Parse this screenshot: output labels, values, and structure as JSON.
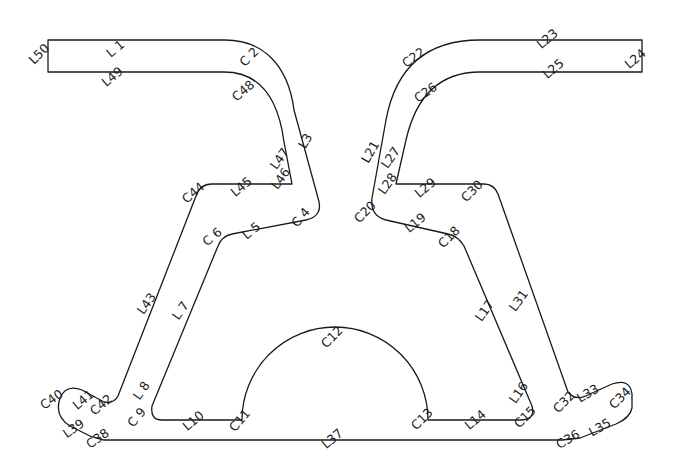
{
  "diagram": {
    "type": "profile-outline",
    "stroke_color": "#1a1a1a",
    "background": "#ffffff",
    "labels": [
      {
        "id": "L1",
        "text": "L 1",
        "x": 118,
        "y": 52,
        "rot": -40
      },
      {
        "id": "C2",
        "text": "C 2",
        "x": 252,
        "y": 60,
        "rot": -45
      },
      {
        "id": "L3",
        "text": "L3",
        "x": 309,
        "y": 143,
        "rot": -60
      },
      {
        "id": "C4",
        "text": "C 4",
        "x": 304,
        "y": 220,
        "rot": -50
      },
      {
        "id": "L5",
        "text": "L 5",
        "x": 254,
        "y": 234,
        "rot": -40
      },
      {
        "id": "C6",
        "text": "C 6",
        "x": 215,
        "y": 240,
        "rot": -40
      },
      {
        "id": "L7",
        "text": "L 7",
        "x": 184,
        "y": 313,
        "rot": -55
      },
      {
        "id": "L8",
        "text": "L 8",
        "x": 145,
        "y": 393,
        "rot": -55
      },
      {
        "id": "C9",
        "text": "C 9",
        "x": 140,
        "y": 420,
        "rot": -50
      },
      {
        "id": "L10",
        "text": "L10",
        "x": 196,
        "y": 424,
        "rot": -40
      },
      {
        "id": "C11",
        "text": "C11",
        "x": 243,
        "y": 423,
        "rot": -50
      },
      {
        "id": "C12",
        "text": "C12",
        "x": 335,
        "y": 340,
        "rot": -45
      },
      {
        "id": "C13",
        "text": "C13",
        "x": 425,
        "y": 422,
        "rot": -45
      },
      {
        "id": "L14",
        "text": "L14",
        "x": 478,
        "y": 423,
        "rot": -40
      },
      {
        "id": "C15",
        "text": "C15",
        "x": 528,
        "y": 420,
        "rot": -45
      },
      {
        "id": "L16",
        "text": "L16",
        "x": 522,
        "y": 395,
        "rot": -55
      },
      {
        "id": "L17",
        "text": "L17",
        "x": 488,
        "y": 313,
        "rot": -55
      },
      {
        "id": "C18",
        "text": "C18",
        "x": 452,
        "y": 240,
        "rot": -45
      },
      {
        "id": "L19",
        "text": "L19",
        "x": 418,
        "y": 226,
        "rot": -40
      },
      {
        "id": "C20",
        "text": "C20",
        "x": 368,
        "y": 215,
        "rot": -45
      },
      {
        "id": "L21",
        "text": "L21",
        "x": 374,
        "y": 154,
        "rot": -60
      },
      {
        "id": "C22",
        "text": "C22",
        "x": 416,
        "y": 61,
        "rot": -35
      },
      {
        "id": "L23",
        "text": "L23",
        "x": 550,
        "y": 42,
        "rot": -40
      },
      {
        "id": "L24",
        "text": "L24",
        "x": 638,
        "y": 62,
        "rot": -40
      },
      {
        "id": "L25",
        "text": "L25",
        "x": 556,
        "y": 72,
        "rot": -40
      },
      {
        "id": "C26",
        "text": "C26",
        "x": 428,
        "y": 96,
        "rot": -35
      },
      {
        "id": "L27",
        "text": "L27",
        "x": 394,
        "y": 160,
        "rot": -55
      },
      {
        "id": "L28",
        "text": "L28",
        "x": 391,
        "y": 186,
        "rot": -55
      },
      {
        "id": "L29",
        "text": "L29",
        "x": 428,
        "y": 191,
        "rot": -40
      },
      {
        "id": "C30",
        "text": "C30",
        "x": 475,
        "y": 194,
        "rot": -45
      },
      {
        "id": "L31",
        "text": "L31",
        "x": 522,
        "y": 303,
        "rot": -55
      },
      {
        "id": "C32",
        "text": "C32",
        "x": 567,
        "y": 405,
        "rot": -45
      },
      {
        "id": "L33",
        "text": "L33",
        "x": 590,
        "y": 397,
        "rot": -30
      },
      {
        "id": "C34",
        "text": "C34",
        "x": 623,
        "y": 401,
        "rot": -45
      },
      {
        "id": "L35",
        "text": "L35",
        "x": 602,
        "y": 431,
        "rot": -30
      },
      {
        "id": "C36",
        "text": "C36",
        "x": 570,
        "y": 443,
        "rot": -30
      },
      {
        "id": "L37",
        "text": "L37",
        "x": 335,
        "y": 442,
        "rot": -40
      },
      {
        "id": "C38",
        "text": "C38",
        "x": 100,
        "y": 442,
        "rot": -35
      },
      {
        "id": "L39",
        "text": "L39",
        "x": 76,
        "y": 432,
        "rot": -35
      },
      {
        "id": "C40",
        "text": "C40",
        "x": 54,
        "y": 403,
        "rot": -35
      },
      {
        "id": "L41",
        "text": "L41",
        "x": 86,
        "y": 403,
        "rot": -40
      },
      {
        "id": "C42",
        "text": "C42",
        "x": 104,
        "y": 408,
        "rot": -40
      },
      {
        "id": "L43",
        "text": "L43",
        "x": 150,
        "y": 306,
        "rot": -55
      },
      {
        "id": "C44",
        "text": "C44",
        "x": 196,
        "y": 196,
        "rot": -40
      },
      {
        "id": "L45",
        "text": "L45",
        "x": 244,
        "y": 190,
        "rot": -40
      },
      {
        "id": "L46",
        "text": "L46",
        "x": 284,
        "y": 181,
        "rot": -55
      },
      {
        "id": "L47",
        "text": "L47",
        "x": 283,
        "y": 161,
        "rot": -55
      },
      {
        "id": "C48",
        "text": "C48",
        "x": 246,
        "y": 94,
        "rot": -40
      },
      {
        "id": "L49",
        "text": "L49",
        "x": 115,
        "y": 80,
        "rot": -40
      },
      {
        "id": "L50",
        "text": "L50",
        "x": 42,
        "y": 57,
        "rot": -45
      }
    ]
  }
}
